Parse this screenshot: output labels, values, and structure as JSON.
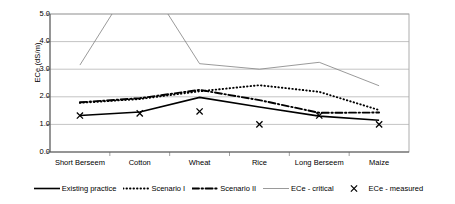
{
  "chart_data": {
    "type": "line",
    "title": "",
    "xlabel": "",
    "ylabel": "ECe (dS/m)",
    "ylim": [
      0.0,
      5.0
    ],
    "ytick_values": [
      0.0,
      1.0,
      2.0,
      3.0,
      4.0,
      5.0
    ],
    "ytick_labels": [
      "0.0",
      "1.0",
      "2.0",
      "3.0",
      "4.0",
      "5.0"
    ],
    "grid": true,
    "legend_position": "bottom",
    "categories": [
      "Short Berseem",
      "Cotton",
      "Wheat",
      "Rice",
      "Long Berseem",
      "Maize"
    ],
    "series": [
      {
        "name": "Existing practice",
        "style": "solid",
        "color": "#000000",
        "values": [
          1.32,
          1.45,
          1.98,
          1.63,
          1.3,
          1.15
        ]
      },
      {
        "name": "Scenario I",
        "style": "dotted",
        "color": "#000000",
        "values": [
          1.78,
          1.92,
          2.2,
          2.42,
          2.18,
          1.52
        ]
      },
      {
        "name": "Scenario II",
        "style": "dashdot",
        "color": "#000000",
        "values": [
          1.8,
          1.95,
          2.25,
          1.88,
          1.42,
          1.43
        ]
      },
      {
        "name": "ECe - critical",
        "style": "thin-solid",
        "color": "#808080",
        "values": [
          3.15,
          6.6,
          3.2,
          3.0,
          3.25,
          2.4
        ]
      },
      {
        "name": "ECe - measured",
        "style": "marker-x",
        "color": "#000000",
        "values": [
          1.32,
          1.4,
          1.47,
          1.0,
          1.32,
          1.0
        ]
      }
    ]
  },
  "axis": {
    "y_title": "ECe (dS/m)"
  },
  "legend": {
    "items": [
      {
        "label": "Existing practice",
        "icon": "solid-line-swatch"
      },
      {
        "label": "Scenario I",
        "icon": "dotted-line-swatch"
      },
      {
        "label": "Scenario II",
        "icon": "dashdot-line-swatch"
      },
      {
        "label": "ECe - critical",
        "icon": "thin-line-swatch"
      },
      {
        "label": "ECe - measured",
        "icon": "x-marker-swatch"
      }
    ]
  }
}
